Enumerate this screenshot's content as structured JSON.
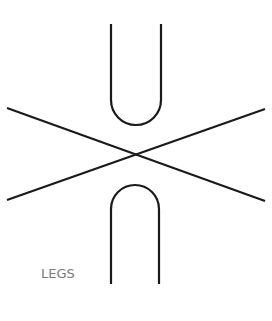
{
  "diagram": {
    "label": "LEGS",
    "colors": {
      "stroke": "#1a1a1a",
      "label": "#7a7a7a",
      "background": "#ffffff"
    },
    "shapes": [
      {
        "type": "u-shape",
        "position": "top"
      },
      {
        "type": "cross-lines",
        "position": "center"
      },
      {
        "type": "inverted-u-shape",
        "position": "bottom"
      }
    ]
  }
}
